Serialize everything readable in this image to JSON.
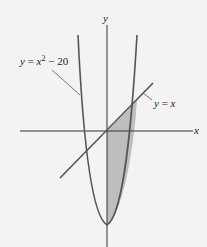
{
  "diagram": {
    "axes": {
      "x_label": "x",
      "y_label": "y"
    },
    "curves": [
      {
        "name": "parabola",
        "label": "y = x² − 20",
        "label_parts": {
          "lhs": "y",
          "eq": " = ",
          "var": "x",
          "exp": "2",
          "rest": " − 20"
        }
      },
      {
        "name": "line",
        "label": "y = x",
        "label_parts": {
          "lhs": "y",
          "eq": " = ",
          "var": "x"
        }
      }
    ],
    "shaded_region": "region between y = x and y = x² − 20 for x ≥ 0",
    "colors": {
      "curve": "#555555",
      "axis": "#333333",
      "shade": "#b8b8b8",
      "background": "#f3f3f3"
    }
  }
}
